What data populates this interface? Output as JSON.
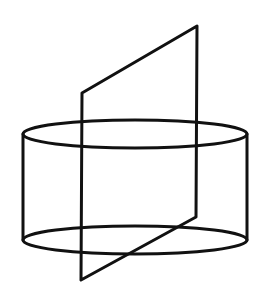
{
  "figure": {
    "title": "Cylinder intersected by a planar quadrilateral",
    "background_color": "#ffffff",
    "stroke_color": "#111111",
    "canvas": {
      "width": 269,
      "height": 301
    },
    "parts": [
      {
        "name": "cylinder-top-ellipse",
        "label": "Top circular face (drawn as ellipse)",
        "type": "ellipse",
        "cx": 135,
        "cy": 134,
        "rx": 112,
        "ry": 14,
        "stroke_width": 3
      },
      {
        "name": "cylinder-bottom-ellipse",
        "label": "Bottom circular face (drawn as ellipse)",
        "type": "ellipse",
        "cx": 135,
        "cy": 240,
        "rx": 112,
        "ry": 14,
        "stroke_width": 3
      },
      {
        "name": "cylinder-left-silhouette",
        "label": "Left silhouette edge of cylinder wall",
        "type": "line",
        "x1": 23,
        "y1": 134,
        "x2": 23,
        "y2": 240,
        "stroke_width": 3
      },
      {
        "name": "cylinder-right-silhouette",
        "label": "Right silhouette edge of cylinder wall",
        "type": "line",
        "x1": 247,
        "y1": 134,
        "x2": 247,
        "y2": 240,
        "stroke_width": 3
      },
      {
        "name": "intersecting-plane",
        "label": "Quadrilateral plane slicing through the cylinder",
        "type": "polygon",
        "points": "82,93 197,26 196,217 81,280",
        "vertices": [
          {
            "name": "plane-vertex-top-left",
            "x": 82,
            "y": 93
          },
          {
            "name": "plane-vertex-top-right",
            "x": 197,
            "y": 26
          },
          {
            "name": "plane-vertex-bottom-right",
            "x": 196,
            "y": 217
          },
          {
            "name": "plane-vertex-bottom-left",
            "x": 81,
            "y": 280
          }
        ],
        "stroke_width": 3
      }
    ]
  }
}
